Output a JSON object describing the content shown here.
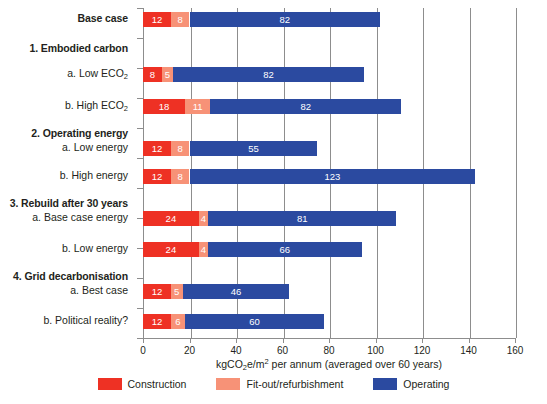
{
  "chart_data": {
    "type": "bar",
    "orientation": "horizontal",
    "stacked": true,
    "title": "",
    "xlabel": "kgCO2e/m2 per annum (averaged over 60 years)",
    "xlabel_parts": {
      "pre": "kgCO",
      "sub1": "2",
      "mid": "e/m",
      "sup1": "2",
      "post": " per annum (averaged over 60 years)"
    },
    "ylabel": "",
    "xlim": [
      0,
      160
    ],
    "xticks": [
      0,
      20,
      40,
      60,
      80,
      100,
      120,
      140,
      160
    ],
    "grid": true,
    "legend_position": "bottom",
    "series": [
      {
        "name": "Construction",
        "color": "#ee3124",
        "values": [
          12,
          8,
          18,
          12,
          12,
          24,
          24,
          12,
          12
        ]
      },
      {
        "name": "Fit-out/refurbishment",
        "color": "#f79277",
        "values": [
          8,
          5,
          11,
          8,
          8,
          4,
          4,
          5,
          6
        ]
      },
      {
        "name": "Operating",
        "color": "#2b4aa0",
        "values": [
          82,
          82,
          82,
          55,
          123,
          81,
          66,
          46,
          60
        ]
      }
    ],
    "categories": [
      "Base case",
      "a. Low ECO2",
      "b. High ECO2",
      "a. Low energy",
      "b. High energy",
      "a. Base case energy",
      "b. Low energy",
      "a. Best case",
      "b. Political reality?"
    ],
    "totals": [
      102,
      95,
      111,
      75,
      143,
      109,
      94,
      63,
      78
    ]
  },
  "rows": [
    {
      "label": "Base case",
      "kind": "heading",
      "bar": 0,
      "slot": 0
    },
    {
      "label": "1. Embodied carbon",
      "kind": "heading",
      "bar": null,
      "slot": 1
    },
    {
      "label_pre": "a. Low ECO",
      "label_sub": "2",
      "kind": "sub",
      "bar": 1,
      "slot": 2
    },
    {
      "label_pre": "b. High ECO",
      "label_sub": "2",
      "kind": "sub",
      "bar": 2,
      "slot": 3
    },
    {
      "label": "2. Operating energy",
      "kind": "heading",
      "bar": null,
      "slot": 4
    },
    {
      "label": "a. Low energy",
      "kind": "sub",
      "bar": 3,
      "slot": 5
    },
    {
      "label": "b. High energy",
      "kind": "sub",
      "bar": 4,
      "slot": 6
    },
    {
      "label": "3. Rebuild after 30 years",
      "kind": "heading",
      "bar": null,
      "slot": 7
    },
    {
      "label": "a. Base case energy",
      "kind": "sub",
      "bar": 5,
      "slot": 8
    },
    {
      "label": "b. Low energy",
      "kind": "sub",
      "bar": 6,
      "slot": 9
    },
    {
      "label": "4. Grid decarbonisation",
      "kind": "heading",
      "bar": null,
      "slot": 10
    },
    {
      "label": "a. Best case",
      "kind": "sub",
      "bar": 7,
      "slot": 11
    },
    {
      "label": "b. Political reality?",
      "kind": "sub",
      "bar": 8,
      "slot": 12
    }
  ],
  "legend": {
    "items": [
      {
        "label": "Construction",
        "color": "#ee3124"
      },
      {
        "label": "Fit-out/refurbishment",
        "color": "#f79277"
      },
      {
        "label": "Operating",
        "color": "#2b4aa0"
      }
    ]
  },
  "colors": {
    "construction": "#ee3124",
    "fitout": "#f79277",
    "operating": "#2b4aa0",
    "axis": "#8d8d8d",
    "text": "#231f20",
    "bar_label": "#ffffff",
    "background": "#ffffff"
  }
}
